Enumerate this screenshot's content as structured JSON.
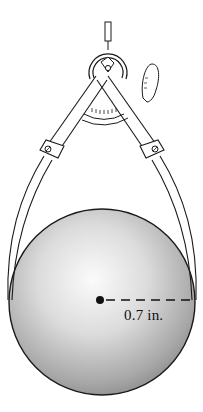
{
  "diagram": {
    "sphere": {
      "radius_label": "0.7 in.",
      "center_marker": "filled-dot",
      "radius_line_style": "dashed"
    },
    "instrument": {
      "type": "outside caliper with protractor dial",
      "parts": [
        "handle-knob",
        "hinge-pivot-screw",
        "arched-spring-bracket",
        "protractor-scale",
        "thumb-tab",
        "left-leg",
        "right-leg",
        "leg-screws"
      ]
    },
    "colors": {
      "line": "#1a1a1a",
      "sphere_light": "#f4f4f4",
      "sphere_dark": "#9a9a9a",
      "background": "#ffffff"
    }
  }
}
